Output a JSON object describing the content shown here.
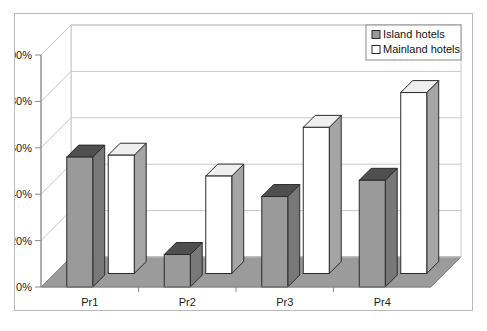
{
  "chart_data": {
    "type": "bar",
    "title": "",
    "subtitle": "",
    "xlabel": "",
    "ylabel": "",
    "categories": [
      "Pr1",
      "Pr2",
      "Pr3",
      "Pr4"
    ],
    "series": [
      {
        "name": "Island hotels",
        "values": [
          56,
          14,
          39,
          46
        ],
        "color": "#9a9a9a"
      },
      {
        "name": "Mainland hotels",
        "values": [
          51,
          42,
          63,
          78
        ],
        "color": "#ffffff"
      }
    ],
    "ylim": [
      0,
      100
    ],
    "yticks": [
      0,
      20,
      40,
      60,
      80,
      100
    ],
    "ytick_labels": [
      "0%",
      "20%",
      "40%",
      "60%",
      "80%",
      "100%"
    ],
    "value_format": "percent",
    "grid": true,
    "grid_axis": "y",
    "legend_position": "top-right",
    "style": "3d-column",
    "colors": {
      "island_face": "#9a9a9a",
      "island_top": "#4f4f4f",
      "island_side": "#787878",
      "mainland_face": "#ffffff",
      "mainland_top": "#efefef",
      "mainland_side": "#a5a5a5",
      "floor": "#9b9b9b",
      "grid_line": "#c8c8c8",
      "axis_line": "#8a8a8a",
      "frame_border": "#b9b9b9",
      "bar_outline": "#2b2b2b"
    }
  },
  "legend": {
    "items": [
      {
        "label": "Island hotels",
        "swatch": "filled-gray-square"
      },
      {
        "label": "Mainland hotels",
        "swatch": "empty-white-square"
      }
    ]
  },
  "axes": {
    "y": {
      "labels": [
        "100%",
        "80%",
        "60%",
        "40%",
        "20%",
        "0%"
      ]
    },
    "x": {
      "labels": [
        "Pr1",
        "Pr2",
        "Pr3",
        "Pr4"
      ]
    }
  }
}
